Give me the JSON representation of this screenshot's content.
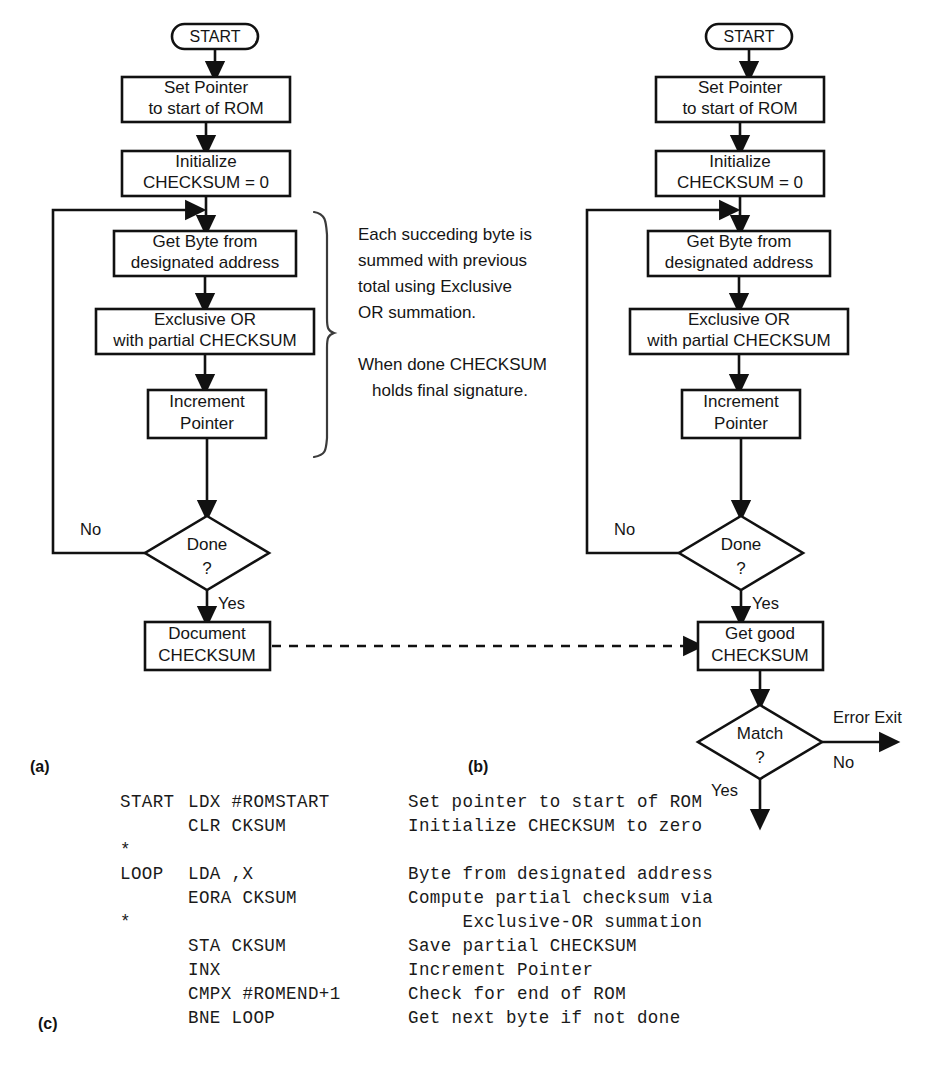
{
  "figure": {
    "panels": [
      {
        "id": "a",
        "label": "(a)"
      },
      {
        "id": "b",
        "label": "(b)"
      },
      {
        "id": "c",
        "label": "(c)"
      }
    ]
  },
  "flowchart_a": {
    "terminal_start": "START",
    "nodes": [
      {
        "id": "set-pointer",
        "line1": "Set Pointer",
        "line2": "to start of ROM"
      },
      {
        "id": "initialize",
        "line1": "Initialize",
        "line2": "CHECKSUM = 0"
      },
      {
        "id": "get-byte",
        "line1": "Get Byte from",
        "line2": "designated address"
      },
      {
        "id": "exclusive-or",
        "line1": "Exclusive OR",
        "line2": "with partial CHECKSUM"
      },
      {
        "id": "increment-pointer",
        "line1": "Increment",
        "line2": "Pointer"
      },
      {
        "id": "document-checksum",
        "line1": "Document",
        "line2": "CHECKSUM"
      }
    ],
    "decision": {
      "id": "done",
      "line1": "Done",
      "line2": "?"
    },
    "edge_labels": {
      "no": "No",
      "yes": "Yes"
    }
  },
  "annotation": {
    "paragraph1": [
      "Each succeding byte is",
      "summed with previous",
      "total using Exclusive",
      "OR summation."
    ],
    "paragraph2": [
      "When done CHECKSUM",
      "holds final signature."
    ]
  },
  "flowchart_b": {
    "terminal_start": "START",
    "nodes": [
      {
        "id": "set-pointer",
        "line1": "Set Pointer",
        "line2": "to start of ROM"
      },
      {
        "id": "initialize",
        "line1": "Initialize",
        "line2": "CHECKSUM = 0"
      },
      {
        "id": "get-byte",
        "line1": "Get Byte from",
        "line2": "designated address"
      },
      {
        "id": "exclusive-or",
        "line1": "Exclusive OR",
        "line2": "with partial CHECKSUM"
      },
      {
        "id": "increment-pointer",
        "line1": "Increment",
        "line2": "Pointer"
      },
      {
        "id": "get-good-checksum",
        "line1": "Get good",
        "line2": "CHECKSUM"
      }
    ],
    "decisions": [
      {
        "id": "done",
        "line1": "Done",
        "line2": "?"
      },
      {
        "id": "match",
        "line1": "Match",
        "line2": "?"
      }
    ],
    "edge_labels": {
      "done_no": "No",
      "done_yes": "Yes",
      "match_yes": "Yes",
      "match_no": "No",
      "error_exit": "Error Exit"
    }
  },
  "code_listing": {
    "lines": [
      {
        "label": "START",
        "mnemonic": "LDX #ROMSTART",
        "comment": "Set pointer to start of ROM"
      },
      {
        "label": "",
        "mnemonic": "CLR CKSUM",
        "comment": "Initialize CHECKSUM to zero"
      },
      {
        "label": "*",
        "mnemonic": "",
        "comment": ""
      },
      {
        "label": "LOOP",
        "mnemonic": "LDA ,X",
        "comment": "Byte from designated address"
      },
      {
        "label": "",
        "mnemonic": "EORA CKSUM",
        "comment": "Compute partial checksum via"
      },
      {
        "label": "*",
        "mnemonic": "",
        "comment": "     Exclusive-OR summation"
      },
      {
        "label": "",
        "mnemonic": "STA CKSUM",
        "comment": "Save partial CHECKSUM"
      },
      {
        "label": "",
        "mnemonic": "INX",
        "comment": "Increment Pointer"
      },
      {
        "label": "",
        "mnemonic": "CMPX #ROMEND+1",
        "comment": "Check for end of ROM"
      },
      {
        "label": "",
        "mnemonic": "BNE LOOP",
        "comment": "Get next byte if not done"
      }
    ]
  }
}
